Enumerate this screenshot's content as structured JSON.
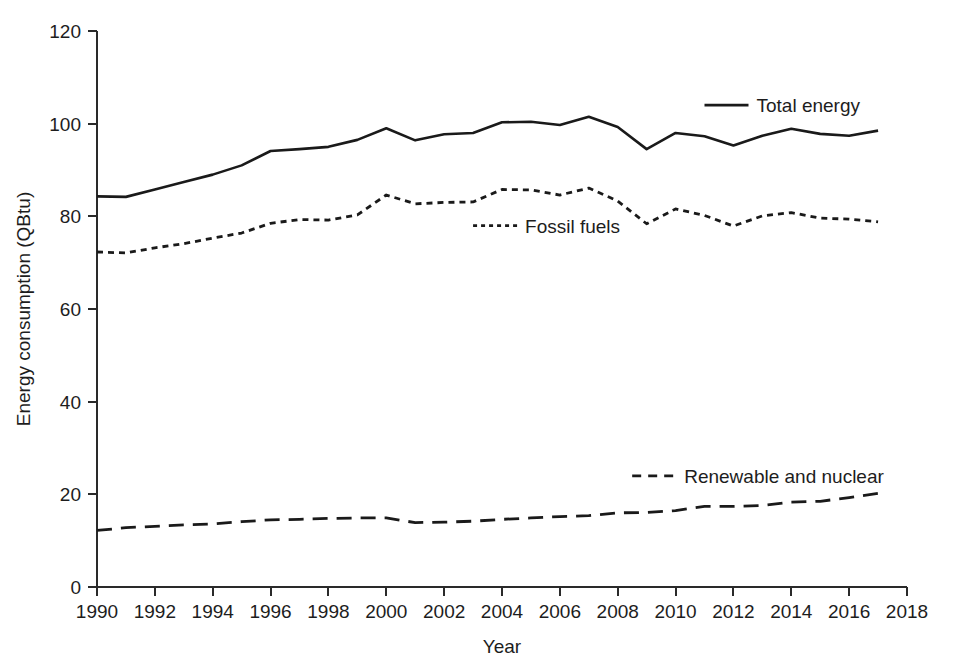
{
  "chart_data": {
    "type": "line",
    "title": "",
    "xlabel": "Year",
    "ylabel": "Energy consumption (QBtu)",
    "xlim": [
      1990,
      2018
    ],
    "ylim": [
      0,
      120
    ],
    "xticks": [
      1990,
      1992,
      1994,
      1996,
      1998,
      2000,
      2002,
      2004,
      2006,
      2008,
      2010,
      2012,
      2014,
      2016,
      2018
    ],
    "yticks": [
      0,
      20,
      40,
      60,
      80,
      100,
      120
    ],
    "grid": false,
    "legend_position": "inline-annotations",
    "x": [
      1990,
      1991,
      1992,
      1993,
      1994,
      1995,
      1996,
      1997,
      1998,
      1999,
      2000,
      2001,
      2002,
      2003,
      2004,
      2005,
      2006,
      2007,
      2008,
      2009,
      2010,
      2011,
      2012,
      2013,
      2014,
      2015,
      2016,
      2017
    ],
    "series": [
      {
        "name": "Total energy",
        "style": "solid",
        "values": [
          84.3,
          84.2,
          85.8,
          87.4,
          89.0,
          91.0,
          94.1,
          94.5,
          95.0,
          96.5,
          99.0,
          96.4,
          97.7,
          98.0,
          100.3,
          100.4,
          99.7,
          101.5,
          99.3,
          94.5,
          98.0,
          97.3,
          95.3,
          97.4,
          98.9,
          97.8,
          97.4,
          98.5
        ]
      },
      {
        "name": "Fossil fuels",
        "style": "dotted",
        "values": [
          72.3,
          72.1,
          73.2,
          74.1,
          75.3,
          76.4,
          78.5,
          79.3,
          79.2,
          80.3,
          84.6,
          82.7,
          83.0,
          83.1,
          85.8,
          85.7,
          84.6,
          86.1,
          83.3,
          78.4,
          81.6,
          80.2,
          77.9,
          80.1,
          80.8,
          79.6,
          79.4,
          78.8
        ]
      },
      {
        "name": "Renewable and nuclear",
        "style": "dashed",
        "values": [
          12.2,
          12.8,
          13.1,
          13.4,
          13.6,
          14.1,
          14.5,
          14.6,
          14.8,
          14.9,
          14.9,
          13.9,
          14.0,
          14.2,
          14.6,
          14.9,
          15.2,
          15.4,
          16.0,
          16.1,
          16.5,
          17.4,
          17.4,
          17.6,
          18.3,
          18.5,
          19.3,
          20.2
        ]
      }
    ],
    "annotations": [
      {
        "label": "Total energy",
        "x": 2011.0,
        "y": 104.0
      },
      {
        "label": "Fossil fuels",
        "x": 2003.0,
        "y": 78.0
      },
      {
        "label": "Renewable and nuclear",
        "x": 2008.5,
        "y": 24.0
      }
    ]
  }
}
